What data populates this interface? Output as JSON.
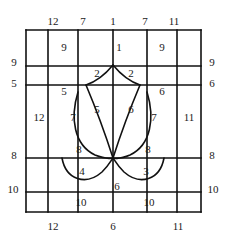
{
  "figure": {
    "stroke_color": "#111111",
    "background": "#ffffff",
    "box": {
      "left": 26,
      "top": 30,
      "right": 201,
      "bottom": 212
    },
    "grid": {
      "vertical_lines_x": [
        26,
        48,
        78,
        113,
        147,
        177,
        201
      ],
      "horizontal_lines_y": [
        30,
        66,
        85,
        158,
        192,
        212
      ]
    }
  },
  "labels": {
    "top": [
      {
        "text": "12",
        "x": 53,
        "y": 21
      },
      {
        "text": "7",
        "x": 83,
        "y": 21
      },
      {
        "text": "1",
        "x": 113,
        "y": 21
      },
      {
        "text": "7",
        "x": 145,
        "y": 21
      },
      {
        "text": "11",
        "x": 174,
        "y": 21
      }
    ],
    "bottom": [
      {
        "text": "12",
        "x": 53,
        "y": 226
      },
      {
        "text": "6",
        "x": 113,
        "y": 226
      },
      {
        "text": "11",
        "x": 178,
        "y": 226
      }
    ],
    "left": [
      {
        "text": "9",
        "x": 14,
        "y": 62
      },
      {
        "text": "5",
        "x": 14,
        "y": 83
      },
      {
        "text": "8",
        "x": 14,
        "y": 155
      },
      {
        "text": "10",
        "x": 13,
        "y": 189
      }
    ],
    "right": [
      {
        "text": "9",
        "x": 212,
        "y": 62
      },
      {
        "text": "6",
        "x": 212,
        "y": 83
      },
      {
        "text": "8",
        "x": 212,
        "y": 155
      },
      {
        "text": "10",
        "x": 213,
        "y": 189
      }
    ],
    "inner": [
      {
        "text": "9",
        "x": 64,
        "y": 47
      },
      {
        "text": "1",
        "x": 119,
        "y": 47
      },
      {
        "text": "9",
        "x": 162,
        "y": 47
      },
      {
        "text": "2",
        "x": 97,
        "y": 73
      },
      {
        "text": "2",
        "x": 131,
        "y": 73
      },
      {
        "text": "5",
        "x": 64,
        "y": 91
      },
      {
        "text": "6",
        "x": 162,
        "y": 91
      },
      {
        "text": "12",
        "x": 39,
        "y": 117
      },
      {
        "text": "7",
        "x": 73,
        "y": 117
      },
      {
        "text": "5",
        "x": 97,
        "y": 109
      },
      {
        "text": "6",
        "x": 131,
        "y": 109
      },
      {
        "text": "7",
        "x": 154,
        "y": 117
      },
      {
        "text": "11",
        "x": 189,
        "y": 117
      },
      {
        "text": "8",
        "x": 79,
        "y": 149
      },
      {
        "text": "8",
        "x": 148,
        "y": 149
      },
      {
        "text": "4",
        "x": 82,
        "y": 171
      },
      {
        "text": "3",
        "x": 146,
        "y": 171
      },
      {
        "text": "6",
        "x": 117,
        "y": 186
      },
      {
        "text": "10",
        "x": 81,
        "y": 202
      },
      {
        "text": "10",
        "x": 149,
        "y": 202
      }
    ]
  },
  "shape": {
    "name": "tulip",
    "apex_point": {
      "x": 113,
      "y": 65
    },
    "petal_left_outer": "M 78,92 C 70,118 74,145 95,155 C 108,160 113,158 113,158",
    "petal_left_top": "M 113,65 C 104,76 95,82 86,85",
    "petal_right_top": "M 113,65 C 122,76 131,82 140,85",
    "petal_right_outer": "M 147,92 C 155,118 151,145 130,155 C 118,160 113,158 113,158",
    "inner_left": "M 86,85 C 94,104 104,130 113,158",
    "inner_right": "M 140,85 C 132,104 122,130 113,158",
    "leaf_left": "M 62,158 C 66,180 86,186 102,172 C 108,166 111,161 113,158",
    "leaf_right": "M 164,158 C 160,180 140,186 124,172 C 118,166 115,161 113,158"
  }
}
